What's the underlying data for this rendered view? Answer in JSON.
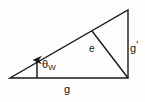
{
  "figure": {
    "kind": "geometry-diagram",
    "background_color": "#fdfdfd",
    "stroke_color": "#1a1a1a",
    "stroke_width": 1.4,
    "text_color": "#151515",
    "width": 145,
    "height": 102
  },
  "geometry": {
    "triangle": {
      "name": "right-triangle",
      "vertices": {
        "left": {
          "x": 10,
          "y": 78
        },
        "bottom_right": {
          "x": 128,
          "y": 78
        },
        "top_right": {
          "x": 128,
          "y": 10
        }
      },
      "points": "10,78 128,78 128,10"
    },
    "inner_segment": {
      "name": "segment-e",
      "from": {
        "x": 92,
        "y": 31
      },
      "to": {
        "x": 128,
        "y": 78
      }
    },
    "angle_arrow": {
      "name": "theta-w-arrow",
      "from": {
        "x": 37,
        "y": 78
      },
      "to": {
        "x": 37,
        "y": 59
      },
      "head_width": 6,
      "head_length": 7
    }
  },
  "labels": {
    "base": {
      "id": "g-base",
      "text": "g",
      "meaning": "base side length"
    },
    "vertical": {
      "id": "g-prime",
      "text": "g",
      "prime": "'",
      "meaning": "vertical side length, g prime"
    },
    "inner": {
      "id": "e",
      "text": "e",
      "meaning": "inner segment length"
    },
    "angle": {
      "id": "theta-w",
      "symbol": "θ",
      "subscript": "W",
      "meaning": "Weinberg angle theta sub W"
    }
  }
}
